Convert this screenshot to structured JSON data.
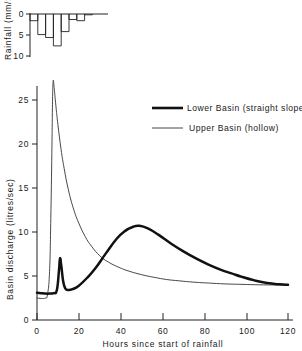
{
  "chart_data": [
    {
      "type": "bar",
      "id": "hyetograph",
      "title": "",
      "xlabel": "",
      "ylabel": "Rainfall (mm/2hrs)",
      "ylim": [
        10,
        0
      ],
      "yticks": [
        0,
        5,
        10
      ],
      "ytick_labels": [
        "0",
        "5",
        "10"
      ],
      "xlim": [
        0,
        24
      ],
      "grid": false,
      "orientation": "inverted-downward",
      "bin_width_hours": 2,
      "categories": [
        "0-2",
        "2-4",
        "4-6",
        "6-8",
        "8-10",
        "10-12",
        "12-14",
        "14-16"
      ],
      "x": [
        0,
        2,
        4,
        6,
        8,
        10,
        12,
        14
      ],
      "values": [
        1.6,
        4.9,
        5.6,
        7.6,
        4.2,
        1.3,
        1.6,
        0.2
      ]
    },
    {
      "type": "line",
      "id": "hydrograph",
      "title": "",
      "xlabel": "Hours since start of rainfall",
      "ylabel": "Basin discharge (litres/sec)",
      "xlim": [
        0,
        120
      ],
      "ylim": [
        0,
        27.5
      ],
      "xticks": [
        0,
        20,
        40,
        60,
        80,
        100,
        120
      ],
      "xtick_labels": [
        "0",
        "20",
        "40",
        "60",
        "80",
        "100",
        "120"
      ],
      "yticks": [
        0,
        5,
        10,
        15,
        20,
        25
      ],
      "ytick_labels": [
        "0",
        "5",
        "10",
        "15",
        "20",
        "25"
      ],
      "grid": false,
      "legend_position": "upper-right",
      "series": [
        {
          "name": "Lower Basin (straight slopes)",
          "style": "thick",
          "x": [
            0,
            2,
            4,
            6,
            8,
            9.5,
            10.5,
            11,
            11.6,
            12.5,
            13.5,
            15,
            17,
            20,
            24,
            28,
            33,
            38,
            42,
            46,
            49,
            53,
            58,
            64,
            70,
            76,
            82,
            88,
            93,
            98,
            104,
            110,
            116,
            120
          ],
          "y": [
            3.1,
            3.05,
            3.0,
            3.0,
            3.05,
            3.4,
            5.6,
            7.0,
            6.2,
            4.4,
            3.6,
            3.4,
            3.5,
            3.9,
            4.8,
            5.9,
            7.6,
            9.2,
            10.1,
            10.6,
            10.7,
            10.4,
            9.7,
            8.7,
            7.8,
            7.0,
            6.3,
            5.7,
            5.3,
            4.9,
            4.5,
            4.2,
            4.05,
            4.0
          ]
        },
        {
          "name": "Upper Basin (hollow)",
          "style": "thin",
          "x": [
            0,
            2,
            4,
            5,
            6,
            6.6,
            7.1,
            7.4,
            7.7,
            8.2,
            9,
            10,
            11.5,
            13,
            15,
            17.5,
            20,
            23,
            26,
            30,
            34,
            39,
            44,
            50,
            56,
            62,
            68,
            75,
            82,
            90,
            98,
            106,
            114,
            120
          ],
          "y": [
            2.5,
            2.45,
            2.5,
            2.9,
            5.5,
            11.5,
            19.0,
            24.5,
            27.1,
            26.4,
            24.4,
            22.2,
            19.4,
            17.2,
            14.8,
            12.6,
            11.0,
            9.5,
            8.4,
            7.3,
            6.6,
            6.0,
            5.55,
            5.15,
            4.85,
            4.6,
            4.45,
            4.3,
            4.2,
            4.1,
            4.05,
            4.0,
            3.98,
            3.95
          ]
        }
      ]
    }
  ],
  "legend": {
    "items": [
      {
        "label": "Lower Basin (straight slopes)",
        "style": "thick"
      },
      {
        "label": "Upper Basin (hollow)",
        "style": "thin"
      }
    ]
  },
  "colors": {
    "lower_basin": "#111111",
    "upper_basin": "#333333",
    "axis": "#222222",
    "background": "#ffffff"
  }
}
